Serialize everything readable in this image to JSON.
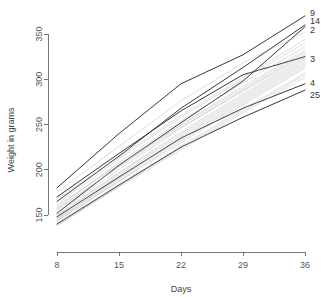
{
  "chart_data": {
    "type": "line",
    "title": "",
    "subtitle": "",
    "xlabel": "Days",
    "ylabel": "Weight in grams",
    "x": [
      8,
      15,
      22,
      29,
      36
    ],
    "xticks": [
      "8",
      "15",
      "22",
      "29",
      "36"
    ],
    "yticks": [
      "150",
      "200",
      "250",
      "300",
      "350"
    ],
    "xlim": [
      8,
      36
    ],
    "ylim": [
      130,
      375
    ],
    "grid": false,
    "legend_position": "right-edge-labels",
    "annotations": [
      "9",
      "14",
      "2",
      "3",
      "4",
      "25"
    ],
    "series": [
      {
        "name": "9",
        "label": "9",
        "highlight": true,
        "values": [
          180,
          240,
          295,
          327,
          370
        ]
      },
      {
        "name": "14",
        "label": "14",
        "highlight": true,
        "values": [
          165,
          215,
          268,
          313,
          360
        ]
      },
      {
        "name": "2",
        "label": "2",
        "highlight": true,
        "values": [
          152,
          205,
          252,
          298,
          358
        ]
      },
      {
        "name": "3",
        "label": "3",
        "highlight": true,
        "values": [
          170,
          218,
          265,
          305,
          325
        ]
      },
      {
        "name": "4",
        "label": "4",
        "highlight": true,
        "values": [
          148,
          192,
          235,
          268,
          295
        ]
      },
      {
        "name": "25",
        "label": "25",
        "highlight": true,
        "values": [
          140,
          183,
          225,
          258,
          288
        ]
      },
      {
        "name": "s07",
        "label": "",
        "highlight": false,
        "values": [
          162,
          212,
          258,
          300,
          340
        ]
      },
      {
        "name": "s08",
        "label": "",
        "highlight": false,
        "values": [
          158,
          208,
          254,
          296,
          336
        ]
      },
      {
        "name": "s09",
        "label": "",
        "highlight": false,
        "values": [
          155,
          204,
          250,
          292,
          332
        ]
      },
      {
        "name": "s10",
        "label": "",
        "highlight": false,
        "values": [
          152,
          200,
          246,
          288,
          328
        ]
      },
      {
        "name": "s11",
        "label": "",
        "highlight": false,
        "values": [
          150,
          197,
          242,
          284,
          324
        ]
      },
      {
        "name": "s12",
        "label": "",
        "highlight": false,
        "values": [
          147,
          194,
          238,
          280,
          320
        ]
      },
      {
        "name": "s13",
        "label": "",
        "highlight": false,
        "values": [
          145,
          190,
          234,
          276,
          316
        ]
      },
      {
        "name": "s14",
        "label": "",
        "highlight": false,
        "values": [
          143,
          187,
          230,
          272,
          312
        ]
      },
      {
        "name": "s15",
        "label": "",
        "highlight": false,
        "values": [
          141,
          184,
          226,
          267,
          307
        ]
      },
      {
        "name": "s16",
        "label": "",
        "highlight": false,
        "values": [
          138,
          181,
          222,
          263,
          302
        ]
      },
      {
        "name": "s17",
        "label": "",
        "highlight": false,
        "values": [
          168,
          214,
          260,
          302,
          344
        ]
      },
      {
        "name": "s18",
        "label": "",
        "highlight": false,
        "values": [
          160,
          206,
          249,
          290,
          330
        ]
      },
      {
        "name": "s19",
        "label": "",
        "highlight": false,
        "values": [
          149,
          196,
          240,
          282,
          322
        ]
      },
      {
        "name": "s20",
        "label": "",
        "highlight": false,
        "values": [
          144,
          188,
          232,
          274,
          314
        ]
      },
      {
        "name": "s21",
        "label": "",
        "highlight": false,
        "values": [
          175,
          226,
          276,
          318,
          352
        ]
      },
      {
        "name": "s22",
        "label": "",
        "highlight": false,
        "values": [
          157,
          203,
          247,
          287,
          326
        ]
      },
      {
        "name": "s23",
        "label": "",
        "highlight": false,
        "values": [
          146,
          191,
          236,
          278,
          318
        ]
      },
      {
        "name": "s24",
        "label": "",
        "highlight": false,
        "values": [
          139,
          182,
          224,
          265,
          305
        ]
      }
    ],
    "colors": {
      "highlight_stroke": "#2b2b2b",
      "faint_stroke": "#9a9a9a",
      "axis": "#666666",
      "text": "#555555",
      "background": "#ffffff"
    }
  }
}
